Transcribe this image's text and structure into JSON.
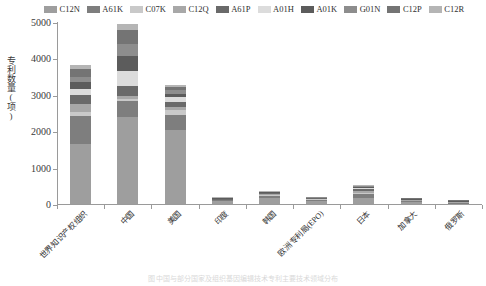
{
  "chart_data": {
    "type": "bar",
    "subtype": "stacked-bar",
    "title": "",
    "xlabel": "",
    "ylabel": "专利数量(项)",
    "ylim": [
      0,
      5000
    ],
    "yticks": [
      0,
      1000,
      2000,
      3000,
      4000,
      5000
    ],
    "grid": false,
    "legend_position": "top",
    "categories": [
      "世界知识产权组织",
      "中国",
      "美国",
      "印度",
      "韩国",
      "欧洲专利局(EPO)",
      "日本",
      "加拿大",
      "俄罗斯"
    ],
    "series": [
      {
        "name": "C12N",
        "color": "#9e9e9e",
        "values": [
          1640,
          2390,
          2040,
          80,
          170,
          95,
          170,
          60,
          12
        ]
      },
      {
        "name": "A61K",
        "color": "#7e7e7e",
        "values": [
          790,
          435,
          405,
          20,
          60,
          25,
          95,
          20,
          5
        ]
      },
      {
        "name": "C07K",
        "color": "#c9c9c9",
        "values": [
          110,
          70,
          130,
          5,
          20,
          8,
          30,
          5,
          2
        ]
      },
      {
        "name": "C12Q",
        "color": "#a8a8a8",
        "values": [
          200,
          70,
          85,
          5,
          25,
          6,
          50,
          5,
          2
        ]
      },
      {
        "name": "A61P",
        "color": "#6a6a6a",
        "values": [
          260,
          290,
          150,
          5,
          20,
          5,
          60,
          5,
          2
        ]
      },
      {
        "name": "A01H",
        "color": "#dcdcdc",
        "values": [
          170,
          400,
          130,
          4,
          12,
          4,
          30,
          4,
          1
        ]
      },
      {
        "name": "A01K",
        "color": "#5c5c5c",
        "values": [
          170,
          420,
          95,
          3,
          10,
          3,
          25,
          3,
          1
        ]
      },
      {
        "name": "G01N",
        "color": "#8d8d8d",
        "values": [
          150,
          330,
          85,
          3,
          10,
          3,
          25,
          3,
          1
        ]
      },
      {
        "name": "C12P",
        "color": "#747474",
        "values": [
          210,
          370,
          90,
          3,
          8,
          3,
          25,
          3,
          1
        ]
      },
      {
        "name": "C12R",
        "color": "#b5b5b5",
        "values": [
          110,
          165,
          50,
          2,
          5,
          2,
          10,
          2,
          1
        ]
      }
    ]
  },
  "caption": "图 中国与部分国家及组织基因编辑技术专利主要技术领域分布"
}
